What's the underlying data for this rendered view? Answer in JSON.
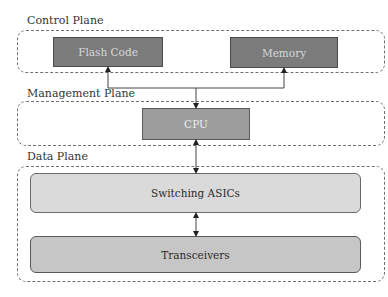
{
  "planes": {
    "control": {
      "label": "Control Plane"
    },
    "management": {
      "label": "Management Plane"
    },
    "data": {
      "label": "Data Plane"
    }
  },
  "components": {
    "flash_code": {
      "label": "Flash Code",
      "color": "#7b7b7b"
    },
    "memory": {
      "label": "Memory",
      "color": "#7b7b7b"
    },
    "cpu": {
      "label": "CPU",
      "color": "#9d9d9d"
    },
    "switching_asics": {
      "label": "Switching ASICs",
      "color": "#dadada"
    },
    "transceivers": {
      "label": "Transceivers",
      "color": "#c6c6c6"
    }
  },
  "connections": [
    {
      "from": "Flash Code",
      "to": "CPU",
      "type": "arrow-to-flash"
    },
    {
      "from": "Memory",
      "to": "CPU",
      "type": "arrow-to-memory"
    },
    {
      "from": "CPU",
      "to": "Switching ASICs",
      "type": "bidirectional"
    },
    {
      "from": "Switching ASICs",
      "to": "Transceivers",
      "type": "bidirectional"
    }
  ]
}
